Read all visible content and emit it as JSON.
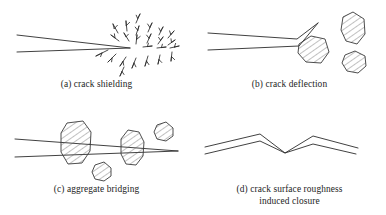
{
  "figure": {
    "kind": "line-diagram",
    "background_color": "#ffffff",
    "ink_color": "#2b2b2b",
    "hatch_color": "#5a5a5a",
    "panels": [
      {
        "id": "a",
        "label": "(a)",
        "caption_lines": [
          "(a) crack shielding"
        ],
        "caption": "(a) crack shielding",
        "elements": [
          "crack-wedge",
          "microcrack-arrow-field"
        ],
        "arrow_count": 24
      },
      {
        "id": "b",
        "label": "(b)",
        "caption_lines": [
          "(b) crack deflection"
        ],
        "caption": "(b) crack deflection",
        "elements": [
          "deflected-crack-wedge",
          "aggregate-large",
          "aggregate-upper-right",
          "aggregate-lower-right"
        ],
        "aggregate_count": 3
      },
      {
        "id": "c",
        "label": "(c)",
        "caption_lines": [
          "(c) aggregate bridging"
        ],
        "caption": "(c) aggregate bridging",
        "elements": [
          "crack-wedge",
          "bridging-aggregate-left",
          "bridging-aggregate-right",
          "aggregate-small-upper-right",
          "aggregate-small-lower-middle"
        ],
        "aggregate_count": 4
      },
      {
        "id": "d",
        "label": "(d)",
        "caption_lines": [
          "(d) crack surface roughness",
          "induced closure"
        ],
        "caption": "(d) crack surface roughness induced closure",
        "elements": [
          "zigzag-crack-upper-face",
          "zigzag-crack-lower-face"
        ]
      }
    ]
  }
}
